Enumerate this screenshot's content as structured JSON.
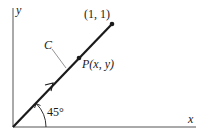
{
  "figure": {
    "axes": {
      "x_label": "x",
      "y_label": "y",
      "origin": [
        13,
        127
      ],
      "x_axis_end": [
        196,
        127
      ],
      "y_axis_top": [
        13,
        8
      ]
    },
    "curve": {
      "label": "C",
      "description": "line segment from origin to (1, 1) at 45 degrees",
      "start": [
        13,
        127
      ],
      "end": [
        112,
        24
      ]
    },
    "endpoint": {
      "label": "(1, 1)",
      "position": [
        112,
        24
      ]
    },
    "point_p": {
      "label": "P(x, y)",
      "position": [
        79,
        58
      ]
    },
    "angle": {
      "label": "45°",
      "degrees": 45
    },
    "colors": {
      "ink": "#1a1a1a",
      "axis": "#444444",
      "leader": "#666666",
      "background": "#ffffff"
    }
  }
}
